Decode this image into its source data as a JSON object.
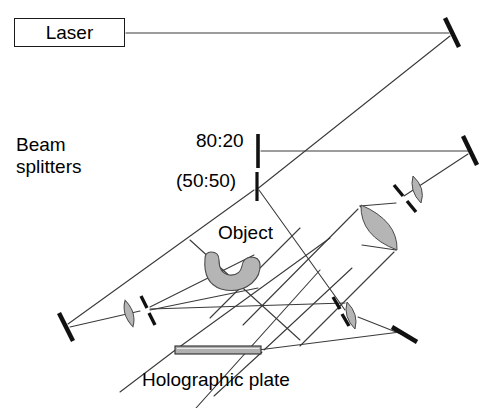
{
  "figure": {
    "type": "optical-setup-diagram",
    "width": 494,
    "height": 408,
    "background_color": "#ffffff",
    "line_color": "#3a3a3a",
    "component_color": "#1a1a1a",
    "glass_fill": "#b5b5b5",
    "plate_fill": "#b0b0b0"
  },
  "labels": {
    "laser": "Laser",
    "beam_splitters_line1": "Beam",
    "beam_splitters_line2": "splitters",
    "ratio_80_20": "80:20",
    "ratio_50_50": "(50:50)",
    "object": "Object",
    "holographic_plate": "Holographic plate"
  },
  "components": [
    {
      "name": "laser-source",
      "kind": "source",
      "x": 14,
      "y": 18,
      "label": "Laser"
    },
    {
      "name": "mirror-top-right",
      "kind": "mirror",
      "x": 452,
      "y": 32,
      "angle": -20
    },
    {
      "name": "beam-splitter-80-20",
      "kind": "beam-splitter",
      "x": 258,
      "y": 150,
      "angle": 0,
      "ratio": "80:20"
    },
    {
      "name": "beam-splitter-50-50",
      "kind": "beam-splitter",
      "x": 257,
      "y": 186,
      "angle": 0,
      "ratio": "(50:50)"
    },
    {
      "name": "mirror-right-middle",
      "kind": "mirror",
      "x": 470,
      "y": 150,
      "angle": -20
    },
    {
      "name": "lens-small-upper-right",
      "kind": "lens",
      "x": 417,
      "y": 189,
      "angle": -35
    },
    {
      "name": "beam-splitter-upper-right",
      "kind": "beam-splitter",
      "x": 400,
      "y": 199,
      "angle": -35
    },
    {
      "name": "lens-large-center-right",
      "kind": "lens",
      "x": 379,
      "y": 224,
      "angle": -35
    },
    {
      "name": "object-sample",
      "kind": "object",
      "x": 233,
      "y": 272
    },
    {
      "name": "mirror-bottom-left",
      "kind": "mirror",
      "x": 66,
      "y": 327,
      "angle": -25
    },
    {
      "name": "lens-bottom-left",
      "kind": "lens",
      "x": 130,
      "y": 313,
      "angle": -20
    },
    {
      "name": "beam-splitter-bottom-left",
      "kind": "beam-splitter",
      "x": 145,
      "y": 310,
      "angle": -20
    },
    {
      "name": "beam-splitter-bottom-right",
      "kind": "beam-splitter",
      "x": 337,
      "y": 313,
      "angle": -25
    },
    {
      "name": "lens-bottom-right",
      "kind": "lens",
      "x": 351,
      "y": 315,
      "angle": -20
    },
    {
      "name": "mirror-bottom-right",
      "kind": "mirror",
      "x": 404,
      "y": 334,
      "angle": -35
    },
    {
      "name": "holographic-plate",
      "kind": "plate",
      "x": 175,
      "y": 347,
      "width": 85,
      "height": 8
    }
  ]
}
